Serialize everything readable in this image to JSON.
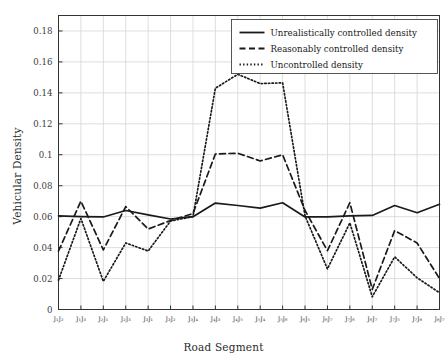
{
  "chart_data": {
    "type": "line",
    "title": "",
    "xlabel": "Road Segment",
    "ylabel": "Vehicular Density",
    "xlim": [
      0,
      17
    ],
    "ylim": [
      0,
      0.19
    ],
    "grid": true,
    "legend_position": "top-right",
    "ytick_labels": [
      "0",
      "0.02",
      "0.04",
      "0.06",
      "0.08",
      "0.1",
      "0.12",
      "0.14",
      "0.16",
      "0.18"
    ],
    "ytick_values": [
      0,
      0.02,
      0.04,
      0.06,
      0.08,
      0.1,
      0.12,
      0.14,
      0.16,
      0.18
    ],
    "categories": [
      "J1J2",
      "J1J3",
      "J2J1",
      "J2J3",
      "J3J1",
      "J3J2",
      "J3J4",
      "J4J3",
      "J4J5",
      "J5J4",
      "J5J6",
      "J6J5",
      "J6J7",
      "J7J6",
      "J6J7b",
      "J7J5",
      "J7J8",
      "J8J7"
    ],
    "categories_display": [
      "J₁J₂",
      "J₁J₃",
      "J₂J₁",
      "J₂J₃",
      "J₃J₁",
      "J₃J₂",
      "J₃J₄",
      "J₄J₃",
      "J₄J₅",
      "J₅J₄",
      "J₅J₆",
      "J₆J₅",
      "J₆J₇",
      "J₇J₆",
      "J₆J₇",
      "J₇J₅",
      "J₇J₈",
      "J₈J₇"
    ],
    "series": [
      {
        "name": "Unrealistically controlled density",
        "style": "solid",
        "color": "#1a1a1a",
        "values": [
          0.0605,
          0.06,
          0.0598,
          0.064,
          0.0612,
          0.0585,
          0.06,
          0.0688,
          0.0672,
          0.0655,
          0.069,
          0.0598,
          0.0598,
          0.0605,
          0.0608,
          0.0672,
          0.0625,
          0.068
        ]
      },
      {
        "name": "Reasonably controlled density",
        "style": "dashed",
        "color": "#1a1a1a",
        "values": [
          0.0378,
          0.07,
          0.0385,
          0.0665,
          0.052,
          0.0575,
          0.062,
          0.1005,
          0.101,
          0.096,
          0.1,
          0.064,
          0.038,
          0.069,
          0.013,
          0.051,
          0.043,
          0.02
        ]
      },
      {
        "name": "Uncontrolled density",
        "style": "dotted",
        "color": "#1a1a1a",
        "values": [
          0.019,
          0.0588,
          0.0182,
          0.043,
          0.0378,
          0.0572,
          0.06,
          0.143,
          0.152,
          0.146,
          0.1465,
          0.0605,
          0.0262,
          0.056,
          0.0082,
          0.034,
          0.0205,
          0.0108
        ]
      }
    ],
    "legend": [
      {
        "label": "Unrealistically controlled density",
        "style": "solid"
      },
      {
        "label": "Reasonably controlled density",
        "style": "dashed"
      },
      {
        "label": "Uncontrolled density",
        "style": "dotted"
      }
    ]
  }
}
